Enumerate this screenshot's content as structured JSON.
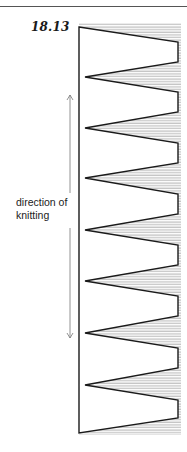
{
  "figure": {
    "label": "18.13",
    "caption_line1": "direction of",
    "caption_line2": "knitting"
  },
  "colors": {
    "ink": "#1a1a1a",
    "hatch": "#8a8a8a",
    "arrow": "#777777",
    "rule": "#555555"
  },
  "shape": {
    "left_x": 79,
    "right_x": 178,
    "valley_x": 85,
    "top_y": 27,
    "bottom_y": 433,
    "valleys_y": [
      77,
      128,
      178,
      230,
      281,
      333,
      385
    ],
    "right_segments": [
      [
        42,
        62
      ],
      [
        92,
        112
      ],
      [
        143,
        163
      ],
      [
        194,
        214
      ],
      [
        245,
        265
      ],
      [
        296,
        316
      ],
      [
        348,
        368
      ],
      [
        400,
        418
      ]
    ]
  },
  "arrow": {
    "x": 70,
    "top_y": 95,
    "bottom_y": 338,
    "gap": [
      193,
      228
    ]
  }
}
